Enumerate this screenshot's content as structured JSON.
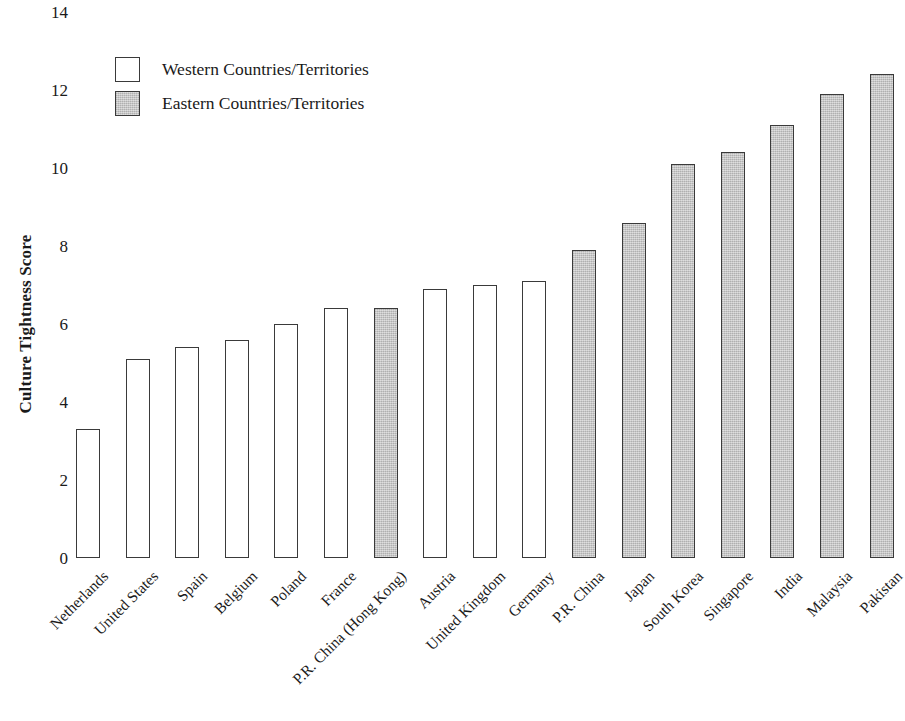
{
  "chart_data": {
    "type": "bar",
    "title": "",
    "subtitle": "",
    "xlabel": "",
    "ylabel": "Culture Tightness Score",
    "ylim": [
      0,
      14
    ],
    "ytick_step": 2,
    "yticks": [
      "0",
      "2",
      "4",
      "6",
      "8",
      "10",
      "12",
      "14"
    ],
    "grid": false,
    "legend_position": "top-left",
    "categories": [
      "Netherlands",
      "United States",
      "Spain",
      "Belgium",
      "Poland",
      "France",
      "P.R. China (Hong Kong)",
      "Austria",
      "United Kingdom",
      "Germany",
      "P.R. China",
      "Japan",
      "South Korea",
      "Singapore",
      "India",
      "Malaysia",
      "Pakistan"
    ],
    "values": [
      3.3,
      5.1,
      5.4,
      5.6,
      6.0,
      6.4,
      6.4,
      6.9,
      7.0,
      7.1,
      7.9,
      8.6,
      10.1,
      10.4,
      11.1,
      11.9,
      12.4
    ],
    "groups": [
      "western",
      "western",
      "western",
      "western",
      "western",
      "western",
      "eastern",
      "western",
      "western",
      "western",
      "eastern",
      "eastern",
      "eastern",
      "eastern",
      "eastern",
      "eastern",
      "eastern"
    ],
    "legend": [
      {
        "key": "western",
        "label": "Western Countries/Territories",
        "color": "#ffffff"
      },
      {
        "key": "eastern",
        "label": "Eastern Countries/Territories",
        "color": "#c3c3c3"
      }
    ],
    "colors": {
      "western_fill": "#ffffff",
      "eastern_fill": "#c3c3c3",
      "bar_border": "#3a3a3a",
      "text": "#1a1a1a",
      "background": "#ffffff"
    }
  }
}
